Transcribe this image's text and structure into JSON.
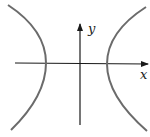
{
  "diagram": {
    "type": "hyperbola",
    "axes": {
      "x_label": "x",
      "y_label": "y"
    },
    "colors": {
      "curve": "#6b6b6b",
      "axis": "#1a1a1a",
      "background": "#ffffff"
    },
    "branches": [
      "left",
      "right"
    ]
  }
}
